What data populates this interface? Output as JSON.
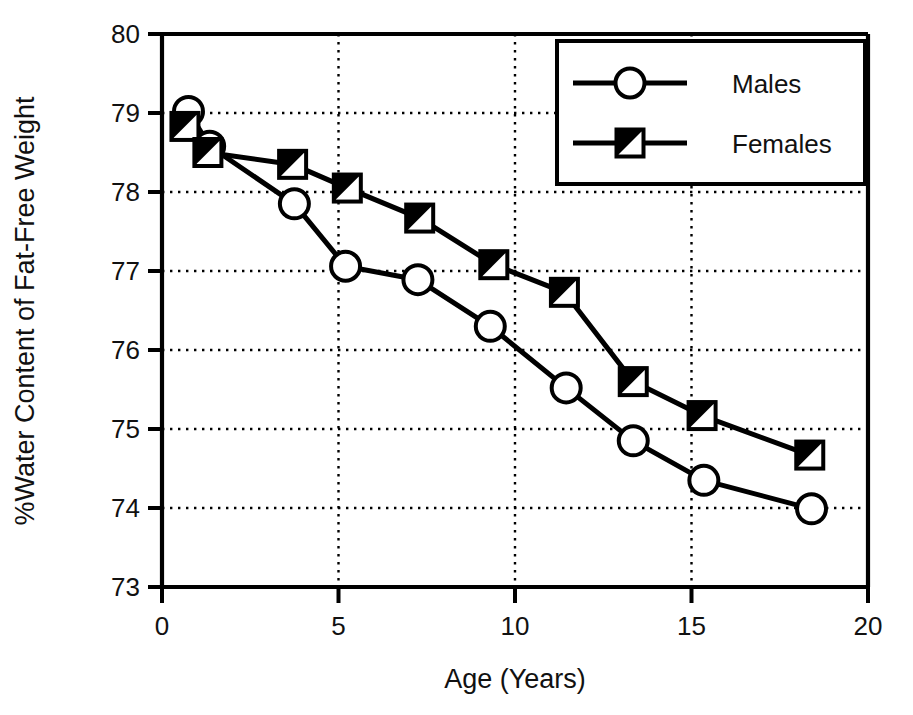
{
  "chart_data": {
    "type": "line",
    "title": "",
    "xlabel": "Age (Years)",
    "ylabel": "%Water Content of Fat-Free Weight",
    "xlim": [
      0,
      20
    ],
    "ylim": [
      73,
      80
    ],
    "xticks": [
      0,
      5,
      10,
      15,
      20
    ],
    "yticks": [
      73,
      74,
      75,
      76,
      77,
      78,
      79,
      80
    ],
    "xtick_labels": [
      "0",
      "5",
      "10",
      "15",
      "20"
    ],
    "ytick_labels": [
      "73",
      "74",
      "75",
      "76",
      "77",
      "78",
      "79",
      "80"
    ],
    "grid": "dotted-both-axes",
    "legend_position": "top-right",
    "series": [
      {
        "name": "Males",
        "marker": "open-circle",
        "color": "#000000",
        "points": [
          {
            "x": 0.75,
            "y": 79.02
          },
          {
            "x": 1.35,
            "y": 78.58
          },
          {
            "x": 3.75,
            "y": 77.85
          },
          {
            "x": 5.2,
            "y": 77.06
          },
          {
            "x": 7.25,
            "y": 76.89
          },
          {
            "x": 9.3,
            "y": 76.3
          },
          {
            "x": 11.45,
            "y": 75.52
          },
          {
            "x": 13.35,
            "y": 74.85
          },
          {
            "x": 15.35,
            "y": 74.35
          },
          {
            "x": 18.4,
            "y": 73.99
          }
        ]
      },
      {
        "name": "Females",
        "marker": "half-filled-square",
        "color": "#000000",
        "points": [
          {
            "x": 0.65,
            "y": 78.83
          },
          {
            "x": 1.3,
            "y": 78.5
          },
          {
            "x": 3.7,
            "y": 78.35
          },
          {
            "x": 5.25,
            "y": 78.05
          },
          {
            "x": 7.3,
            "y": 77.67
          },
          {
            "x": 9.4,
            "y": 77.08
          },
          {
            "x": 11.4,
            "y": 76.73
          },
          {
            "x": 13.35,
            "y": 75.6
          },
          {
            "x": 15.3,
            "y": 75.17
          },
          {
            "x": 18.35,
            "y": 74.67
          }
        ]
      }
    ],
    "legend": [
      {
        "label": "Males",
        "marker": "open-circle"
      },
      {
        "label": "Females",
        "marker": "half-filled-square"
      }
    ]
  }
}
